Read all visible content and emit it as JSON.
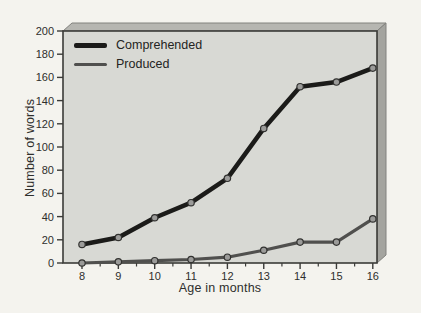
{
  "figure": {
    "background": "#f4f3ee",
    "plot_face_color": "#d8d9d4",
    "slab_top_color": "#b6b6b1",
    "slab_side_color": "#a4a49f",
    "slab_edge_color": "#82827e",
    "frame_color": "#3b3b38",
    "text_color": "#2e2e2c"
  },
  "chart_data": {
    "type": "line",
    "title": "",
    "xlabel": "Age in months",
    "ylabel": "Number of words",
    "x": [
      8,
      9,
      10,
      11,
      12,
      13,
      14,
      15,
      16
    ],
    "xlim": [
      7.5,
      16.1
    ],
    "ylim": [
      0,
      200
    ],
    "yticks": [
      0,
      20,
      40,
      60,
      80,
      100,
      120,
      140,
      160,
      180,
      200
    ],
    "grid": false,
    "legend_position": "top-left",
    "series": [
      {
        "name": "Comprehended",
        "color": "#1b1b19",
        "line_width": 4.5,
        "values": [
          16,
          22,
          39,
          52,
          73,
          116,
          152,
          156,
          168
        ]
      },
      {
        "name": "Produced",
        "color": "#50504e",
        "line_width": 3.2,
        "values": [
          0,
          1,
          2,
          3,
          5,
          11,
          18,
          18,
          38
        ]
      }
    ],
    "marker": {
      "fill": "#9b9b99",
      "stroke": "#323230",
      "radius": 3.2
    }
  }
}
